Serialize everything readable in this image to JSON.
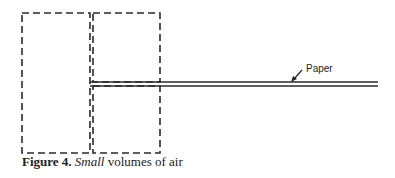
{
  "figure": {
    "label_text": "Paper",
    "caption": {
      "number": "Figure 4.",
      "emphasis": "Small",
      "rest": " volumes of air"
    },
    "colors": {
      "stroke": "#2a2a2a",
      "background": "#ffffff"
    },
    "elements": {
      "left_box": {
        "x": 22,
        "y": 13,
        "w": 68,
        "h": 140
      },
      "right_upper_box": {
        "x": 93,
        "y": 13,
        "w": 67,
        "h": 69
      },
      "right_lower_box": {
        "x": 93,
        "y": 86,
        "w": 67,
        "h": 67
      },
      "paper_lines": {
        "x1": 90,
        "x2": 378,
        "y_top": 82,
        "y_bottom": 86
      }
    }
  }
}
